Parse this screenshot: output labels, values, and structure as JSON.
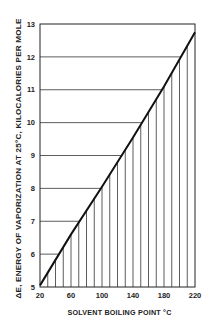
{
  "chart_data": {
    "type": "line",
    "title": "",
    "xlabel": "SOLVENT BOILING POINT °C",
    "ylabel": "ΔE, ENERGY OF VAPORIZATION AT 25°C, KILOCALORIES PER MOLE",
    "xlim": [
      20,
      220
    ],
    "ylim": [
      5,
      13
    ],
    "x_ticks": [
      20,
      60,
      100,
      140,
      180,
      220
    ],
    "y_ticks": [
      5,
      6,
      7,
      8,
      9,
      10,
      11,
      12,
      13
    ],
    "grid": "horizontal lines at each y tick; vertical hatching under the line every 10 °C",
    "legend": null,
    "series": [
      {
        "name": "ΔE vs boiling point",
        "x": [
          20,
          60,
          100,
          140,
          180,
          220
        ],
        "y": [
          5.05,
          6.6,
          8.05,
          9.55,
          11.1,
          12.75
        ]
      }
    ],
    "hatch_step": 10,
    "colors": {
      "line": "#1a1a1a",
      "grid": "#333333",
      "background": "#ffffff"
    }
  }
}
